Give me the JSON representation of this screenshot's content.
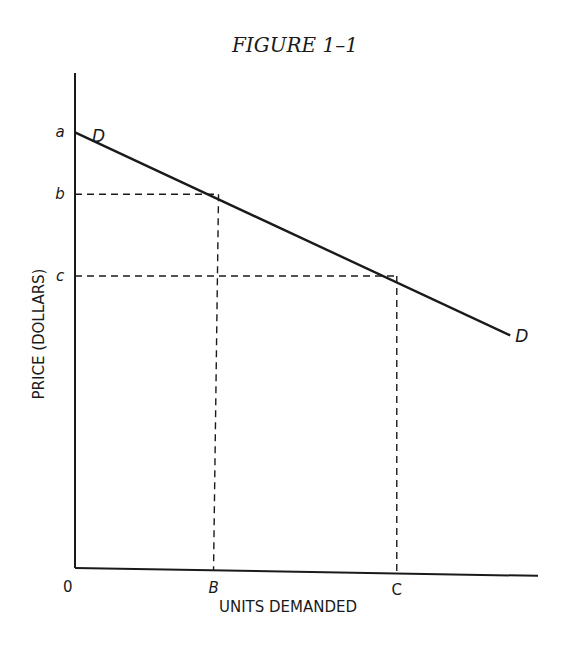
{
  "chart_data": {
    "type": "line",
    "title": "FIGURE 1–1",
    "xlabel": "UNITS DEMANDED",
    "ylabel": "PRICE (DOLLARS)",
    "origin_label": "0",
    "xlim": [
      0,
      100
    ],
    "ylim": [
      0,
      100
    ],
    "grid": false,
    "legend": "none",
    "series": [
      {
        "name": "D",
        "start_label": "D",
        "end_label": "D",
        "x": [
          0,
          94
        ],
        "y": [
          88,
          47
        ]
      }
    ],
    "price_levels": [
      {
        "label": "a",
        "y": 88,
        "x_on_curve": 0
      },
      {
        "label": "b",
        "y": 75.5,
        "x_on_curve": 31
      },
      {
        "label": "c",
        "y": 59,
        "x_on_curve": 69.5
      }
    ],
    "quantity_levels": [
      {
        "label": "B",
        "x": 31
      },
      {
        "label": "C",
        "x": 69.5
      }
    ],
    "colors": {
      "ink": "#1a1a1a",
      "background": "#ffffff"
    }
  }
}
